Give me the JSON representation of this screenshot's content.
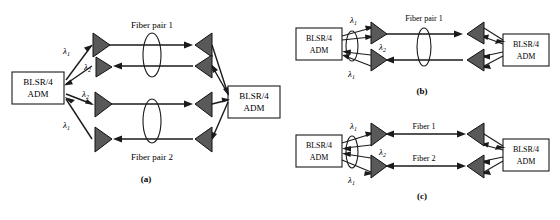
{
  "figure": {
    "type": "network-diagram",
    "panels": [
      {
        "id": "a",
        "caption": "(a)",
        "node_label_line1": "BLSR/4",
        "node_label_line2": "ADM",
        "fiber_labels": [
          "Fiber pair 1",
          "Fiber pair 2"
        ],
        "wavelength_labels": [
          "λ",
          "λ",
          "λ",
          "λ"
        ],
        "wavelength_subs": [
          "1",
          "2",
          "2",
          "1"
        ],
        "amplifier_count": 8,
        "ellipse_count": 2
      },
      {
        "id": "b",
        "caption": "(b)",
        "node_label_line1": "BLSR/4",
        "node_label_line2": "ADM",
        "fiber_labels": [
          "Fiber pair 1"
        ],
        "wavelength_labels": [
          "λ",
          "λ",
          "λ"
        ],
        "wavelength_subs": [
          "1",
          "2",
          "1"
        ],
        "amplifier_count": 4,
        "ellipse_count": 2
      },
      {
        "id": "c",
        "caption": "(c)",
        "node_label_line1": "BLSR/4",
        "node_label_line2": "ADM",
        "fiber_labels": [
          "Fiber 1",
          "Fiber 2"
        ],
        "wavelength_labels": [
          "λ",
          "λ",
          "λ"
        ],
        "wavelength_subs": [
          "1",
          "2",
          "1"
        ],
        "amplifier_count": 4,
        "ellipse_count": 1
      }
    ],
    "colors": {
      "background": "#ffffff",
      "line": "#1a1a1a",
      "amplifier_fill": "#595959",
      "box_fill": "#ffffff",
      "text": "#000000"
    }
  },
  "panel_a": {
    "caption": "(a)",
    "left_node": {
      "line1": "BLSR/4",
      "line2": "ADM"
    },
    "right_node": {
      "line1": "BLSR/4",
      "line2": "ADM"
    },
    "fiber_top": "Fiber pair 1",
    "fiber_bottom": "Fiber pair 2",
    "lambda": {
      "l1a": "λ",
      "s1a": "1",
      "l2a": "λ",
      "s2a": "2",
      "l2b": "λ",
      "s2b": "2",
      "l1b": "λ",
      "s1b": "1"
    }
  },
  "panel_b": {
    "caption": "(b)",
    "left_node": {
      "line1": "BLSR/4",
      "line2": "ADM"
    },
    "right_node": {
      "line1": "BLSR/4",
      "line2": "ADM"
    },
    "fiber_top": "Fiber pair 1",
    "lambda": {
      "l1a": "λ",
      "s1a": "1",
      "l2a": "λ",
      "s2a": "2",
      "l1b": "λ",
      "s1b": "1"
    }
  },
  "panel_c": {
    "caption": "(c)",
    "left_node": {
      "line1": "BLSR/4",
      "line2": "ADM"
    },
    "right_node": {
      "line1": "BLSR/4",
      "line2": "ADM"
    },
    "fiber_top": "Fiber 1",
    "fiber_bottom": "Fiber 2",
    "lambda": {
      "l1a": "λ",
      "s1a": "1",
      "l2a": "λ",
      "s2a": "2",
      "l1b": "λ",
      "s1b": "1"
    }
  }
}
